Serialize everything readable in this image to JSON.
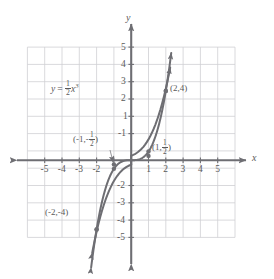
{
  "figure": {
    "kind": "cartesian-graph",
    "axis_labels": {
      "x": "x",
      "y": "y"
    },
    "caption": ""
  },
  "equation": {
    "lhs": "y",
    "equals": "=",
    "coefficient_numerator": "1",
    "coefficient_denominator": "2",
    "variable": "x",
    "exponent": "3",
    "plain": "y = 1/2 x^3"
  },
  "ticks": {
    "x_negative": [
      "-5",
      "-4",
      "-3",
      "-2"
    ],
    "x_positive": [
      "1",
      "2",
      "3",
      "4",
      "5"
    ],
    "y_positive": [
      "1",
      "2",
      "3",
      "4",
      "5"
    ],
    "y_negative": [
      "-1",
      "-2",
      "-3",
      "-4",
      "-5"
    ]
  },
  "points": [
    {
      "name": "point-2-4",
      "x": 2,
      "y": 4,
      "label_open": "(",
      "label_x": "2",
      "label_comma": ",",
      "label_y": "4",
      "label_close": ")",
      "label_plain": "(2,4)"
    },
    {
      "name": "point-1-half",
      "x": 1,
      "y": 0.5,
      "label_open": "(",
      "label_x": "1",
      "label_comma": ",",
      "label_num": "1",
      "label_den": "2",
      "label_close": ")",
      "label_plain": "(1, 1/2)"
    },
    {
      "name": "point-neg1-neg-half",
      "x": -1,
      "y": -0.5,
      "label_open": "(",
      "label_x": "-1",
      "label_comma": ",",
      "label_sign": "-",
      "label_num": "1",
      "label_den": "2",
      "label_close": ")",
      "label_plain": "(-1, -1/2)"
    },
    {
      "name": "point-neg2-neg4",
      "x": -2,
      "y": -4,
      "label_open": "(",
      "label_x": "-2",
      "label_comma": ",",
      "label_y": "-4",
      "label_close": ")",
      "label_plain": "(-2,-4)"
    }
  ],
  "colors": {
    "grid": "#cfcfd3",
    "grid_border": "#bfbfc4",
    "axis": "#6e6e73",
    "curve": "#6e6e73",
    "text": "#5a5a5a",
    "background": "#ffffff"
  },
  "chart_data": {
    "type": "line",
    "title": "",
    "xlabel": "x",
    "ylabel": "y",
    "xlim": [
      -6,
      6
    ],
    "ylim": [
      -6,
      6
    ],
    "grid": true,
    "legend": "none",
    "function": "y = 0.5 * x^3",
    "annotations": [
      "y = 1/2 x^3",
      "(2,4)",
      "(1, 1/2)",
      "(-1, -1/2)",
      "(-2,-4)"
    ],
    "series": [
      {
        "name": "y = 1/2 x^3",
        "x": [
          -2.25,
          -2.0,
          -1.75,
          -1.5,
          -1.25,
          -1.0,
          -0.75,
          -0.5,
          -0.25,
          0,
          0.25,
          0.5,
          0.75,
          1.0,
          1.25,
          1.5,
          1.75,
          2.0,
          2.25
        ],
        "values": [
          -5.7,
          -4.0,
          -2.68,
          -1.69,
          -0.98,
          -0.5,
          -0.21,
          -0.06,
          -0.008,
          0,
          0.008,
          0.06,
          0.21,
          0.5,
          0.98,
          1.69,
          2.68,
          4.0,
          5.7
        ]
      }
    ],
    "marked_points": [
      {
        "x": 2,
        "y": 4
      },
      {
        "x": 1,
        "y": 0.5
      },
      {
        "x": -1,
        "y": -0.5
      },
      {
        "x": -2,
        "y": -4
      }
    ],
    "xticks": [
      -5,
      -4,
      -3,
      -2,
      -1,
      1,
      2,
      3,
      4,
      5
    ],
    "yticks": [
      -5,
      -4,
      -3,
      -2,
      -1,
      1,
      2,
      3,
      4,
      5
    ]
  }
}
